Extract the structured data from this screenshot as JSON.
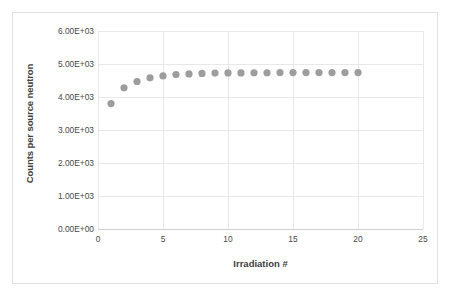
{
  "chart_data": {
    "type": "scatter",
    "title": "",
    "xlabel": "Irradiation #",
    "ylabel": "Counts per source neutron",
    "xlim": [
      0,
      25
    ],
    "ylim": [
      0,
      6000
    ],
    "grid": true,
    "legend": "none",
    "marker_color": "#9d9d9d",
    "gridline_color": "#e8e8e8",
    "axis_color": "#d0d0d0",
    "x_ticks": [
      "0",
      "5",
      "10",
      "15",
      "20",
      "25"
    ],
    "x_tick_values": [
      0,
      5,
      10,
      15,
      20,
      25
    ],
    "y_ticks": [
      "0.00E+00",
      "1.00E+03",
      "2.00E+03",
      "3.00E+03",
      "4.00E+03",
      "5.00E+03",
      "6.00E+03"
    ],
    "y_tick_values": [
      0,
      1000,
      2000,
      3000,
      4000,
      5000,
      6000
    ],
    "x": [
      1,
      2,
      3,
      4,
      5,
      6,
      7,
      8,
      9,
      10,
      11,
      12,
      13,
      14,
      15,
      16,
      17,
      18,
      19,
      20
    ],
    "values": [
      3800,
      4280,
      4470,
      4580,
      4640,
      4680,
      4700,
      4715,
      4725,
      4730,
      4730,
      4735,
      4735,
      4740,
      4740,
      4740,
      4740,
      4740,
      4740,
      4740
    ],
    "series": [
      {
        "name": "Counts per source neutron",
        "values": [
          3800,
          4280,
          4470,
          4580,
          4640,
          4680,
          4700,
          4715,
          4725,
          4730,
          4730,
          4735,
          4735,
          4740,
          4740,
          4740,
          4740,
          4740,
          4740,
          4740
        ]
      }
    ]
  }
}
